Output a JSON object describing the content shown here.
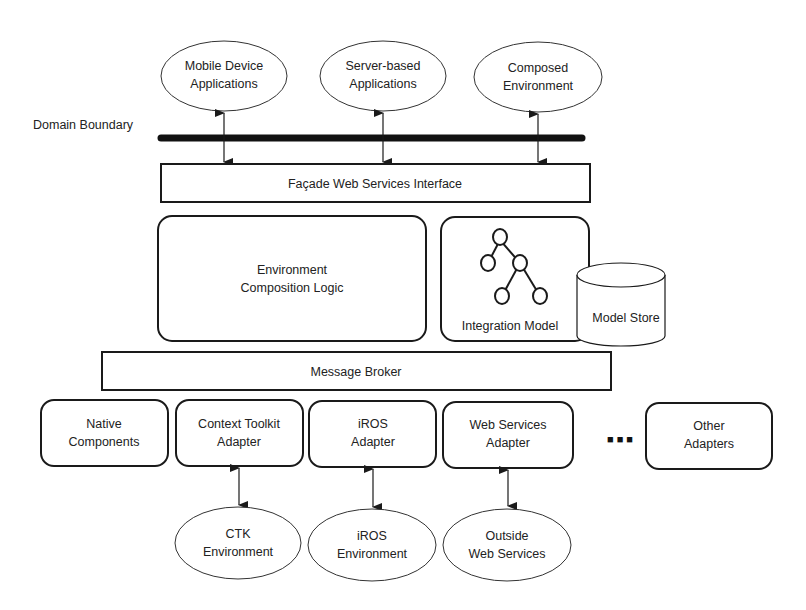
{
  "diagram": {
    "domain_boundary_label": "Domain Boundary",
    "top_clients": [
      {
        "line1": "Mobile Device",
        "line2": "Applications"
      },
      {
        "line1": "Server-based",
        "line2": "Applications"
      },
      {
        "line1": "Composed",
        "line2": "Environment"
      }
    ],
    "facade": "Façade Web Services Interface",
    "composition_logic": {
      "line1": "Environment",
      "line2": "Composition Logic"
    },
    "integration_model": "Integration Model",
    "model_store": "Model Store",
    "message_broker": "Message Broker",
    "adapters": [
      {
        "line1": "Native",
        "line2": "Components"
      },
      {
        "line1": "Context Toolkit",
        "line2": "Adapter"
      },
      {
        "line1": "iROS",
        "line2": "Adapter"
      },
      {
        "line1": "Web Services",
        "line2": "Adapter"
      },
      {
        "line1": "Other",
        "line2": "Adapters"
      }
    ],
    "ellipsis": "■ ■ ■",
    "external_environments": [
      {
        "line1": "CTK",
        "line2": "Environment"
      },
      {
        "line1": "iROS",
        "line2": "Environment"
      },
      {
        "line1": "Outside",
        "line2": "Web Services"
      }
    ]
  }
}
